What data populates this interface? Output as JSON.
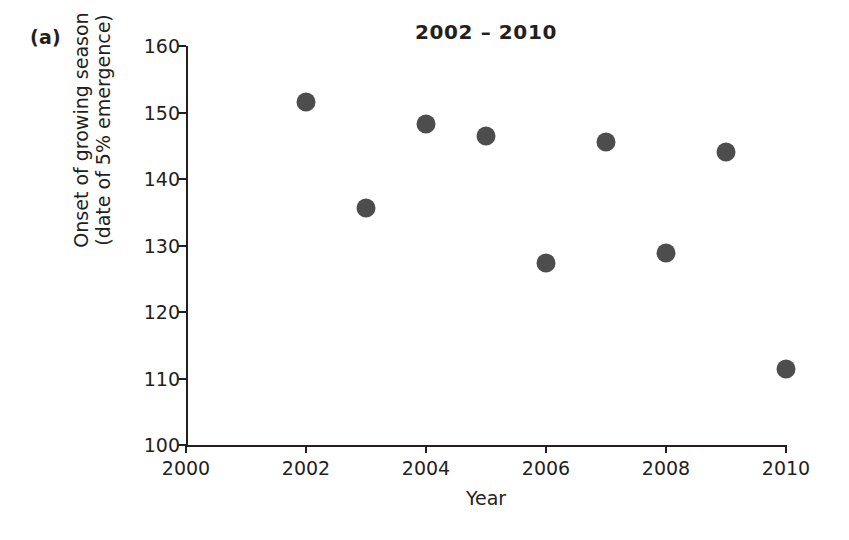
{
  "panel": {
    "label": "(a)"
  },
  "axis_titles": {
    "x": "Year",
    "y_line1": "Onset of growing season",
    "y_line2": "(date of 5% emergence)"
  },
  "style": {
    "marker_color": "#4d4d4d",
    "axis_color": "#231f20",
    "background": "#ffffff"
  },
  "chart_data": {
    "type": "scatter",
    "title": "2002 – 2010",
    "xlabel": "Year",
    "ylabel": "Onset of growing season (date of 5% emergence)",
    "xlim": [
      2000,
      2010
    ],
    "ylim": [
      100,
      160
    ],
    "xticks": [
      2000,
      2002,
      2004,
      2006,
      2008,
      2010
    ],
    "yticks": [
      100,
      110,
      120,
      130,
      140,
      150,
      160
    ],
    "xtick_labels": [
      "2000",
      "2002",
      "2004",
      "2006",
      "2008",
      "2010"
    ],
    "ytick_labels": [
      "100",
      "110",
      "120",
      "130",
      "140",
      "150",
      "160"
    ],
    "grid": false,
    "legend": null,
    "series": [
      {
        "name": "Onset of growing season",
        "marker": "circle",
        "color": "#4d4d4d",
        "x": [
          2002,
          2003,
          2004,
          2005,
          2006,
          2007,
          2008,
          2009,
          2010
        ],
        "y": [
          151.6,
          135.6,
          148.3,
          146.4,
          127.3,
          145.5,
          128.9,
          144.1,
          111.4
        ]
      }
    ]
  }
}
